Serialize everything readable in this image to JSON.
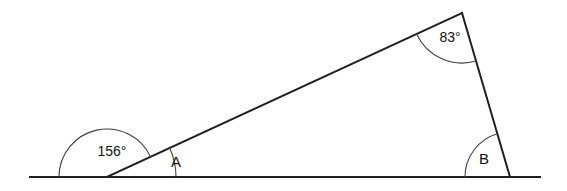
{
  "figure": {
    "type": "geometry-diagram",
    "background_color": "#ffffff",
    "line_color": "#1f1f1f",
    "arc_color": "#404040",
    "text_color": "#101010",
    "canvas": {
      "width": 567,
      "height": 191
    }
  },
  "points": {
    "baseline_left_end": {
      "x": 30,
      "y": 177
    },
    "baseline_right_end": {
      "x": 540,
      "y": 177
    },
    "vertex_a": {
      "x": 107,
      "y": 177
    },
    "vertex_apex": {
      "x": 462,
      "y": 13
    },
    "vertex_b": {
      "x": 510,
      "y": 177
    }
  },
  "lines": [
    {
      "name": "baseline",
      "from": {
        "x": 30,
        "y": 177
      },
      "to": {
        "x": 540,
        "y": 177
      }
    },
    {
      "name": "transversal",
      "from": {
        "x": 107,
        "y": 177
      },
      "to": {
        "x": 462,
        "y": 13
      }
    },
    {
      "name": "right-side",
      "from": {
        "x": 462,
        "y": 13
      },
      "to": {
        "x": 510,
        "y": 177
      }
    }
  ],
  "angles": [
    {
      "id": "exterior-156",
      "label": "156°",
      "value": 156,
      "unit": "degrees",
      "vertex": {
        "x": 107,
        "y": 177
      },
      "radius": 48,
      "start_deg": 180,
      "end_deg": 24.8,
      "label_pos": {
        "x": 112,
        "y": 152
      },
      "label_class": "label-measure"
    },
    {
      "id": "angle-a",
      "label": "A",
      "value": null,
      "unit": "degrees",
      "vertex": {
        "x": 107,
        "y": 177
      },
      "radius": 69,
      "start_deg": 24.8,
      "end_deg": 0,
      "label_pos": {
        "x": 176,
        "y": 163
      },
      "label_class": "label-vertex"
    },
    {
      "id": "apex-83",
      "label": "83°",
      "value": 83,
      "unit": "degrees",
      "vertex": {
        "x": 462,
        "y": 13
      },
      "radius": 50,
      "start_deg": 204.8,
      "end_deg": 286.3,
      "label_pos": {
        "x": 450,
        "y": 38
      },
      "label_class": "label-measure"
    },
    {
      "id": "angle-b",
      "label": "B",
      "value": null,
      "unit": "degrees",
      "vertex": {
        "x": 510,
        "y": 177
      },
      "radius": 45,
      "start_deg": 180,
      "end_deg": 106.3,
      "label_pos": {
        "x": 484,
        "y": 160
      },
      "label_class": "label-vertex"
    }
  ],
  "labels": {
    "exterior_angle_text": "156°",
    "apex_angle_text": "83°",
    "angle_a_text": "A",
    "angle_b_text": "B"
  }
}
